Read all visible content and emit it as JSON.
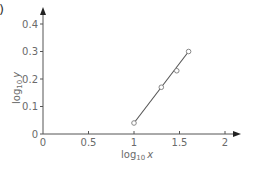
{
  "panel_label_fragment": ")",
  "colors": {
    "axis": "#555555",
    "line": "#555555",
    "marker": "#888888",
    "text": "#6a6a6a"
  },
  "chart_data": {
    "type": "scatter",
    "title": "",
    "xlabel": "log10 x",
    "ylabel": "log10 y",
    "xlim": [
      0,
      2
    ],
    "ylim": [
      0,
      0.4
    ],
    "x_ticks": [
      "0",
      "0.5",
      "1",
      "1.5",
      "2"
    ],
    "y_ticks": [
      "0",
      "0.1",
      "0.2",
      "0.3",
      "0.4"
    ],
    "grid": false,
    "legend": null,
    "series": [
      {
        "name": "data points",
        "x": [
          1.0,
          1.3,
          1.47,
          1.6
        ],
        "y": [
          0.04,
          0.17,
          0.23,
          0.3
        ]
      }
    ],
    "fit_line": {
      "x": [
        1.0,
        1.6
      ],
      "y": [
        0.04,
        0.3
      ]
    }
  },
  "labels": {
    "xlabel_main": "log",
    "xlabel_sub": "10",
    "xlabel_var": "x",
    "ylabel_main": "log",
    "ylabel_sub": "10",
    "ylabel_var": "y"
  }
}
